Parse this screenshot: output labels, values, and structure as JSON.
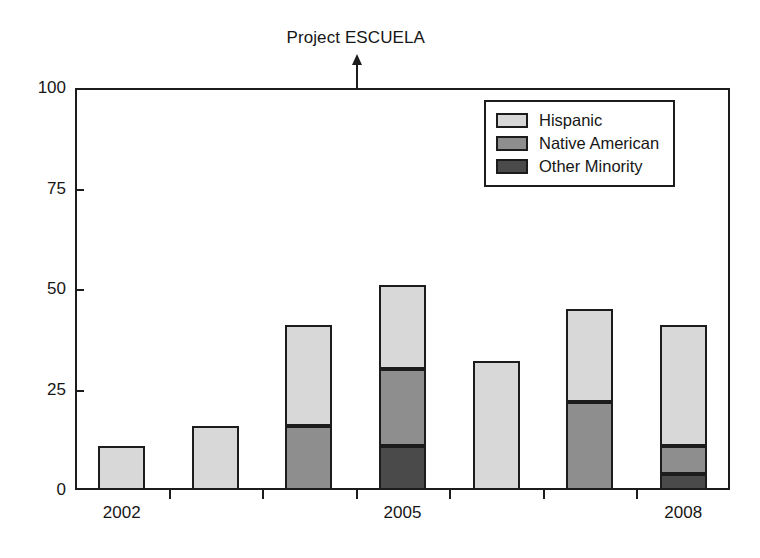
{
  "chart_data": {
    "type": "bar",
    "title": "",
    "annotation": "Project ESCUELA",
    "annotation_x_category": "between 2004 and 2005",
    "xlabel": "",
    "ylabel": "",
    "ylim": [
      0,
      100
    ],
    "yticks": [
      0,
      25,
      50,
      75,
      100
    ],
    "ytick_labels": [
      "0",
      "25",
      "50",
      "75",
      "100"
    ],
    "grid": false,
    "stacked": true,
    "legend_position": "upper right",
    "categories": [
      "2002",
      "2003",
      "2004",
      "2005",
      "2006",
      "2007",
      "2008"
    ],
    "xtick_labels_shown": [
      "2002",
      "",
      "",
      "2005",
      "",
      "",
      "2008"
    ],
    "series": [
      {
        "name": "Hispanic",
        "color": "#d8d8d8",
        "values": [
          11,
          16,
          25,
          21,
          32,
          23,
          30
        ]
      },
      {
        "name": "Native American",
        "color": "#8e8e8e",
        "values": [
          0,
          0,
          16,
          19,
          0,
          22,
          7
        ]
      },
      {
        "name": "Other Minority",
        "color": "#4a4a4a",
        "values": [
          0,
          0,
          0,
          11,
          0,
          0,
          4
        ]
      }
    ],
    "totals": [
      11,
      16,
      41,
      51,
      32,
      45,
      41
    ]
  },
  "legend": {
    "items": [
      {
        "label": "Hispanic",
        "swatch": "light-gray-swatch"
      },
      {
        "label": "Native American",
        "swatch": "medium-gray-swatch"
      },
      {
        "label": "Other Minority",
        "swatch": "dark-gray-swatch"
      }
    ]
  },
  "colors": {
    "hispanic": "#d8d8d8",
    "native_american": "#8e8e8e",
    "other_minority": "#4a4a4a",
    "outline": "#1c1c1c",
    "background": "#ffffff"
  }
}
